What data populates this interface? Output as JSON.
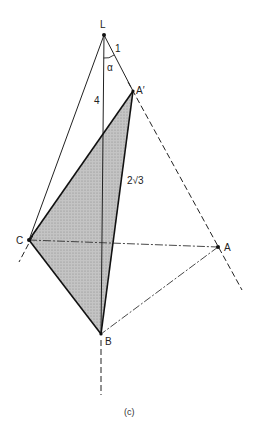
{
  "diagram": {
    "caption": "(c)",
    "points": {
      "L": {
        "label": "L",
        "x": 104,
        "y": 35
      },
      "A_prime": {
        "label": "A′",
        "x": 133,
        "y": 91
      },
      "C": {
        "label": "C",
        "x": 29,
        "y": 240
      },
      "A": {
        "label": "A",
        "x": 218,
        "y": 247
      },
      "B": {
        "label": "B",
        "x": 101,
        "y": 334
      }
    },
    "edge_labels": {
      "LA_prime": "1",
      "LB": "4",
      "A_primeB": "2√3",
      "angle": "α"
    },
    "colors": {
      "line": "#222222",
      "shade": "#b8b8b8",
      "background": "#ffffff"
    }
  }
}
